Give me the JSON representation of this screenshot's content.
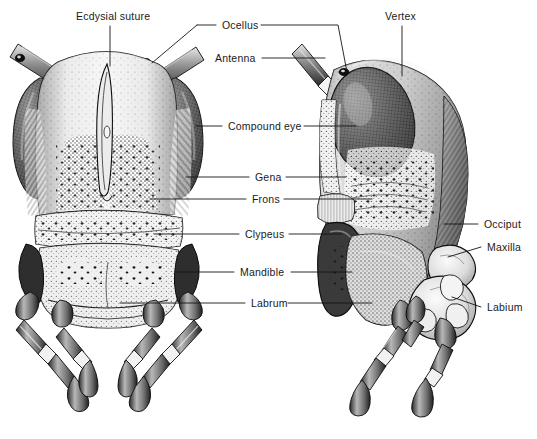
{
  "figure": {
    "kind": "scientific-illustration",
    "views": [
      {
        "name": "anterior-view",
        "side": "left"
      },
      {
        "name": "lateral-view",
        "side": "right"
      }
    ],
    "background_color": "#ffffff",
    "ink_color": "#1a1a1a",
    "style": "stipple-engraving"
  },
  "labels": [
    {
      "id": "ecdysial-suture",
      "text": "Ecdysial suture",
      "x": 76,
      "y": 11
    },
    {
      "id": "ocellus",
      "text": "Ocellus",
      "x": 222,
      "y": 20
    },
    {
      "id": "vertex",
      "text": "Vertex",
      "x": 385,
      "y": 11
    },
    {
      "id": "antenna",
      "text": "Antenna",
      "x": 215,
      "y": 53
    },
    {
      "id": "compound-eye",
      "text": "Compound eye",
      "x": 228,
      "y": 121
    },
    {
      "id": "gena",
      "text": "Gena",
      "x": 255,
      "y": 172
    },
    {
      "id": "frons",
      "text": "Frons",
      "x": 252,
      "y": 194
    },
    {
      "id": "clypeus",
      "text": "Clypeus",
      "x": 245,
      "y": 229
    },
    {
      "id": "occiput",
      "text": "Occiput",
      "x": 484,
      "y": 219
    },
    {
      "id": "maxilla",
      "text": "Maxilla",
      "x": 487,
      "y": 242
    },
    {
      "id": "mandible",
      "text": "Mandible",
      "x": 240,
      "y": 267
    },
    {
      "id": "labrum",
      "text": "Labrum",
      "x": 251,
      "y": 298
    },
    {
      "id": "labium",
      "text": "Labium",
      "x": 487,
      "y": 302
    }
  ]
}
